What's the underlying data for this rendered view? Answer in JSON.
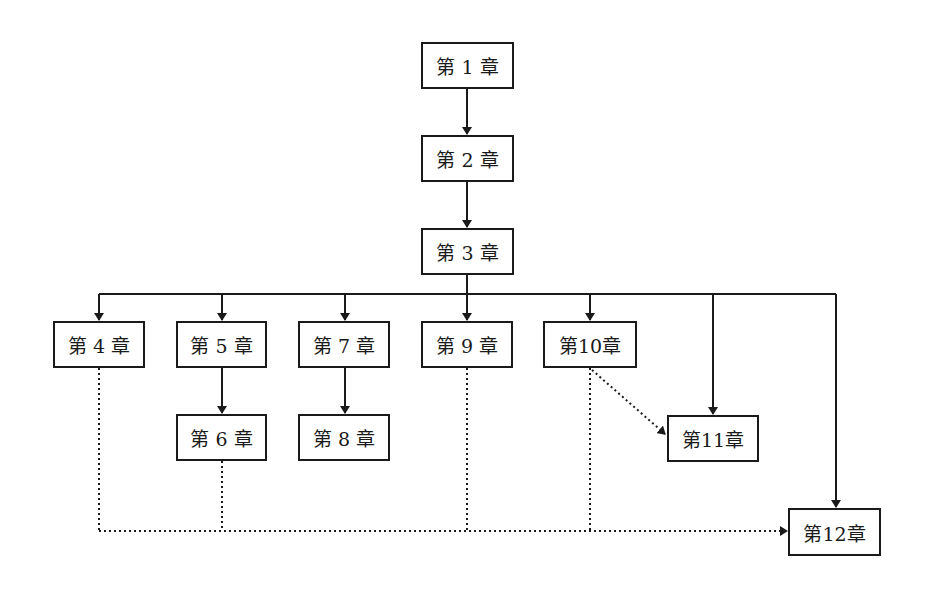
{
  "diagram": {
    "title": "",
    "colors": {
      "line": "#1a1a1a",
      "background": "#ffffff"
    },
    "nodes": [
      {
        "id": "ch1",
        "label": "第 1 章",
        "x": 421,
        "y": 42,
        "w": 93,
        "h": 47
      },
      {
        "id": "ch2",
        "label": "第 2 章",
        "x": 421,
        "y": 135,
        "w": 93,
        "h": 47
      },
      {
        "id": "ch3",
        "label": "第 3 章",
        "x": 421,
        "y": 228,
        "w": 93,
        "h": 47
      },
      {
        "id": "ch4",
        "label": "第 4 章",
        "x": 53,
        "y": 321,
        "w": 92,
        "h": 47
      },
      {
        "id": "ch5",
        "label": "第 5 章",
        "x": 176,
        "y": 321,
        "w": 91,
        "h": 47
      },
      {
        "id": "ch6",
        "label": "第 6 章",
        "x": 176,
        "y": 414,
        "w": 91,
        "h": 47
      },
      {
        "id": "ch7",
        "label": "第 7 章",
        "x": 298,
        "y": 321,
        "w": 92,
        "h": 47
      },
      {
        "id": "ch8",
        "label": "第 8 章",
        "x": 298,
        "y": 414,
        "w": 92,
        "h": 47
      },
      {
        "id": "ch9",
        "label": "第 9 章",
        "x": 421,
        "y": 321,
        "w": 92,
        "h": 47
      },
      {
        "id": "ch10",
        "label": "第10章",
        "x": 543,
        "y": 321,
        "w": 94,
        "h": 47
      },
      {
        "id": "ch11",
        "label": "第11章",
        "x": 667,
        "y": 415,
        "w": 92,
        "h": 47
      },
      {
        "id": "ch12",
        "label": "第12章",
        "x": 788,
        "y": 508,
        "w": 93,
        "h": 48
      }
    ],
    "edges": [
      {
        "from": "ch1",
        "to": "ch2",
        "style": "solid"
      },
      {
        "from": "ch2",
        "to": "ch3",
        "style": "solid"
      },
      {
        "from": "ch3",
        "to": "ch4",
        "style": "solid"
      },
      {
        "from": "ch3",
        "to": "ch5",
        "style": "solid"
      },
      {
        "from": "ch3",
        "to": "ch7",
        "style": "solid"
      },
      {
        "from": "ch3",
        "to": "ch9",
        "style": "solid"
      },
      {
        "from": "ch3",
        "to": "ch10",
        "style": "solid"
      },
      {
        "from": "ch3",
        "to": "ch11",
        "style": "solid"
      },
      {
        "from": "ch3",
        "to": "ch12",
        "style": "solid"
      },
      {
        "from": "ch5",
        "to": "ch6",
        "style": "solid"
      },
      {
        "from": "ch7",
        "to": "ch8",
        "style": "solid"
      },
      {
        "from": "ch10",
        "to": "ch11",
        "style": "dotted"
      },
      {
        "from": "ch4",
        "to": "ch12",
        "style": "dotted"
      },
      {
        "from": "ch6",
        "to": "ch12",
        "style": "dotted"
      },
      {
        "from": "ch9",
        "to": "ch12",
        "style": "dotted"
      },
      {
        "from": "ch10",
        "to": "ch12",
        "style": "dotted"
      }
    ]
  }
}
